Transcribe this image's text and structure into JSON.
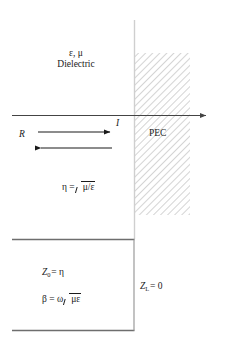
{
  "figure": {
    "name": "plane-wave-incident-on-pec-diagram",
    "background_color": "#ffffff",
    "line_color": "#555555",
    "axis_color": "#444444",
    "arrow_color": "#1a1a1a",
    "hatch_color": "#b9b9b9",
    "interface_line_color": "#cfcfcf",
    "text_color": "#1a1a1a"
  },
  "labels": {
    "medium_params": "ε, μ",
    "medium_name": "Dielectric",
    "incident": "I",
    "reflected": "R",
    "conductor": "PEC",
    "eta_lhs": "η =",
    "eta_radicand": "μ/ε",
    "z0": "Z",
    "z0_sub": "0",
    "z0_rhs": "= η",
    "beta_lhs": "β = ω",
    "beta_radicand": "με",
    "zl": "Z",
    "zl_sub": "L",
    "zl_rhs": "= 0"
  },
  "geometry": {
    "axis_y": 115,
    "axis_x_start": 12,
    "axis_x_end": 212,
    "interface_x": 134,
    "hatch_x": 134,
    "hatch_width": 56,
    "hatch_y": 53,
    "hatch_height": 162,
    "incident_arrow": {
      "x1": 38,
      "x2": 115,
      "y": 132
    },
    "reflected_arrow": {
      "x1": 112,
      "x2": 36,
      "y": 148
    },
    "tl_box": {
      "left": 12,
      "right": 134,
      "top": 239,
      "bottom": 330
    }
  }
}
